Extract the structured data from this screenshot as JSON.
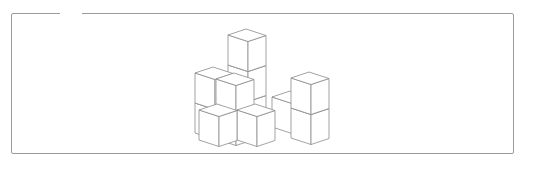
{
  "figure": {
    "line_color": "#8c8c8c",
    "fill_color": "#ffffff",
    "frame_color": "#9a9a9a",
    "iso_vectors": {
      "a": [
        20,
        6.5
      ],
      "b": [
        18,
        -6
      ],
      "level_height": 30
    },
    "cubes": [
      {
        "name": "back-column",
        "top_left_vertex": [
          228,
          35
        ],
        "levels": 3
      },
      {
        "name": "left-back-stack",
        "top_left_vertex": [
          195,
          73
        ],
        "levels": 2
      },
      {
        "name": "middle-back-floor",
        "top_left_vertex": [
          272,
          97
        ],
        "levels": 1
      },
      {
        "name": "right-tower",
        "top_left_vertex": [
          291,
          78
        ],
        "levels": 2
      },
      {
        "name": "front-left-stack",
        "top_left_vertex": [
          216,
          79
        ],
        "levels": 2
      },
      {
        "name": "front-middle-floor",
        "top_left_vertex": [
          237,
          110
        ],
        "levels": 1
      },
      {
        "name": "front-left-floor",
        "top_left_vertex": [
          199,
          110
        ],
        "levels": 1
      }
    ],
    "cube_count_visible": 13
  }
}
